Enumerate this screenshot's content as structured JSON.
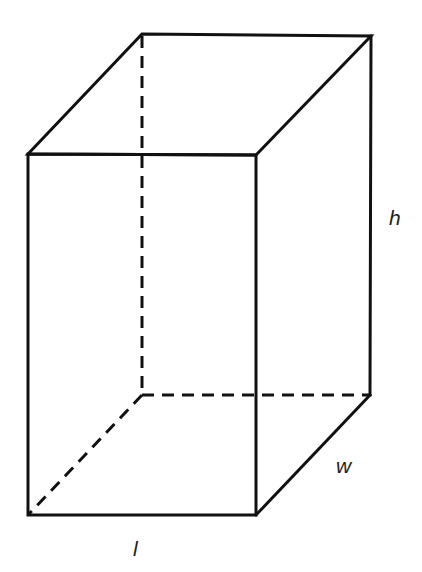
{
  "figure": {
    "type": "rectangular-prism",
    "labels": {
      "height": "h",
      "width": "w",
      "length": "l"
    },
    "colors": {
      "stroke": "#111111",
      "background": "#ffffff",
      "label": "#222222"
    }
  }
}
